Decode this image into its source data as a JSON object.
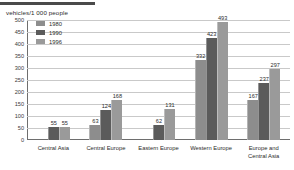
{
  "chart_data": {
    "type": "bar",
    "title": "",
    "ylabel": "vehicles/1 000 people",
    "xlabel": "",
    "ylim": [
      0,
      500
    ],
    "yticks": [
      500,
      450,
      400,
      350,
      300,
      250,
      200,
      150,
      100,
      50,
      0
    ],
    "grid": true,
    "legend_position": "top-left",
    "categories": [
      "Central Asia",
      "Central Europe",
      "Eastern Europe",
      "Western Europe",
      "Europe and Central Asia"
    ],
    "series": [
      {
        "name": "1980",
        "color": "#8d8d8d",
        "values": [
          null,
          63,
          null,
          332,
          167
        ]
      },
      {
        "name": "1990",
        "color": "#5b5b5b",
        "values": [
          55,
          124,
          62,
          423,
          237
        ]
      },
      {
        "name": "1996",
        "color": "#9a9a9a",
        "values": [
          55,
          168,
          131,
          493,
          297
        ]
      }
    ]
  },
  "legend": {
    "items": [
      {
        "label": "1980",
        "key": "s1980"
      },
      {
        "label": "1990",
        "key": "s1990"
      },
      {
        "label": "1996",
        "key": "s1996"
      }
    ]
  },
  "xlabels": [
    {
      "line1": "Central Asia",
      "line2": ""
    },
    {
      "line1": "Central Europe",
      "line2": ""
    },
    {
      "line1": "Eastern Europe",
      "line2": ""
    },
    {
      "line1": "Western Europe",
      "line2": ""
    },
    {
      "line1": "Europe and",
      "line2": "Central Asia"
    }
  ]
}
